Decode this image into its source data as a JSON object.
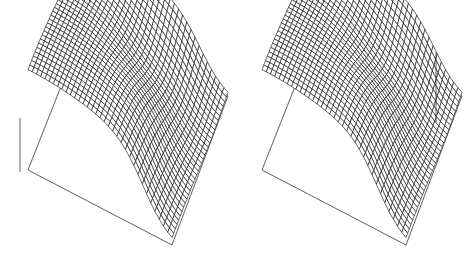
{
  "figure": {
    "name": "dual-wireframe-surface-figure",
    "width": 468,
    "height": 266,
    "background_color": "#ffffff",
    "ink_color": "#0d0d0d",
    "axis_color": "#1a1a1a",
    "panel_count": 2,
    "title": "",
    "caption": ""
  },
  "chart_data": {
    "type": "surface",
    "render_style": "wireframe-mesh",
    "title": "",
    "subtitle": "",
    "xlabel": "",
    "ylabel": "",
    "zlabel": "",
    "grid": true,
    "legend": null,
    "legend_position": "none",
    "tick_labels": {
      "x": [],
      "y": [],
      "z": []
    },
    "axis_ranges": {
      "xlim": [
        0,
        1
      ],
      "ylim": [
        0,
        1
      ],
      "zlim": [
        0,
        1
      ]
    },
    "projection": {
      "kind": "oblique-parallel",
      "azimuth_deg": -38,
      "elevation_deg": 26,
      "note": "grid rows/cols drawn as connected polylines, no perspective foreshortening"
    },
    "grid_resolution": {
      "nx": 34,
      "ny": 34
    },
    "surface_model": {
      "description": "Smooth plateau with a broad central saddle depression and a steep descending fold along the right-hand edge; gentle upward lift toward the near-left corner.",
      "terms": [
        {
          "name": "ridge_fold",
          "type": "logistic",
          "amplitude": 1.0,
          "center_u": 0.8,
          "steepness": 11.0,
          "axis": "u"
        },
        {
          "name": "saddle_dip",
          "type": "gaussian",
          "amplitude": -0.34,
          "center_u": 0.62,
          "center_v": 0.3,
          "sigma_u": 0.2,
          "sigma_v": 0.22
        },
        {
          "name": "corner_lift",
          "type": "gaussian",
          "amplitude": 0.16,
          "center_u": 0.06,
          "center_v": 0.92,
          "sigma_u": 0.4,
          "sigma_v": 0.4
        },
        {
          "name": "gentle_tilt",
          "type": "linear",
          "amplitude": 0.1,
          "slope_u": -0.35,
          "slope_v": 0.12
        }
      ]
    },
    "panels": [
      {
        "id": "panel-left",
        "index": 0,
        "label": "",
        "z_scale": 1.0,
        "corners_px": {
          "top": [
            88,
            18
          ],
          "left": [
            28,
            170
          ],
          "bottom": [
            172,
            245
          ],
          "right": [
            228,
            96
          ]
        },
        "z_axis": {
          "x": 20,
          "y_top": 118,
          "y_bottom": 172,
          "visible": true
        },
        "base_outline_visible": true
      },
      {
        "id": "panel-right",
        "index": 1,
        "label": "",
        "z_scale": 1.0,
        "corners_px": {
          "top": [
            88,
            18
          ],
          "left": [
            28,
            170
          ],
          "bottom": [
            172,
            245
          ],
          "right": [
            228,
            96
          ]
        },
        "z_axis": {
          "x": 202,
          "y_top": 52,
          "y_bottom": 122,
          "visible": true
        },
        "base_outline_visible": true
      }
    ]
  }
}
